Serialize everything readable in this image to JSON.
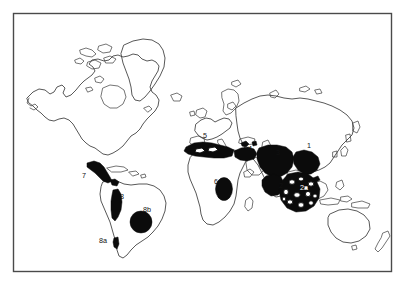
{
  "figure": {
    "kind": "world-distribution-map",
    "projection_note": "equirectangular world outline",
    "background_color": "#ffffff",
    "frame_color": "#4a4a4a",
    "coastline_color": "#3a3a3a",
    "range_fill_color": "#0b0b0b",
    "label_color": "#111111",
    "label_color_on_fill": "#ffffff"
  },
  "frame": {
    "x": 13,
    "y": 13,
    "width": 379,
    "height": 259
  },
  "labels": [
    {
      "id": "label-1",
      "text": "1",
      "x": 307,
      "y": 148,
      "on_fill": false
    },
    {
      "id": "label-2",
      "text": "2",
      "x": 279,
      "y": 188,
      "on_fill": false
    },
    {
      "id": "label-2a",
      "text": "2a",
      "x": 307,
      "y": 188,
      "on_fill": true
    },
    {
      "id": "label-3",
      "text": "3",
      "x": 276,
      "y": 155,
      "on_fill": false
    },
    {
      "id": "label-4",
      "text": "4",
      "x": 248,
      "y": 151,
      "on_fill": false
    },
    {
      "id": "label-5",
      "text": "5",
      "x": 203,
      "y": 138,
      "on_fill": false
    },
    {
      "id": "label-6",
      "text": "6",
      "x": 214,
      "y": 184,
      "on_fill": false
    },
    {
      "id": "label-7",
      "text": "7",
      "x": 82,
      "y": 178,
      "on_fill": false
    },
    {
      "id": "label-8",
      "text": "8",
      "x": 120,
      "y": 199,
      "on_fill": false
    },
    {
      "id": "label-8a",
      "text": "8a",
      "x": 102,
      "y": 243,
      "on_fill": false
    },
    {
      "id": "label-8b",
      "text": "8b",
      "x": 143,
      "y": 212,
      "on_fill": false
    }
  ],
  "regions": [
    {
      "id": "region-1",
      "label": "1",
      "area": "eastern-china-korea"
    },
    {
      "id": "region-2",
      "label": "2",
      "area": "south-asia-india"
    },
    {
      "id": "region-2a",
      "label": "2a",
      "area": "indian-subcontinent-mottled"
    },
    {
      "id": "region-3",
      "label": "3",
      "area": "central-asia"
    },
    {
      "id": "region-4",
      "label": "4",
      "area": "anatolia-caucasus"
    },
    {
      "id": "region-5",
      "label": "5",
      "area": "mediterranean-north-africa"
    },
    {
      "id": "region-6",
      "label": "6",
      "area": "west-africa"
    },
    {
      "id": "region-7",
      "label": "7",
      "area": "mexico-central-america"
    },
    {
      "id": "region-8",
      "label": "8",
      "area": "andes-south-america"
    },
    {
      "id": "region-8a",
      "label": "8a",
      "area": "central-chile"
    },
    {
      "id": "region-8b",
      "label": "8b",
      "area": "southeast-brazil"
    }
  ]
}
